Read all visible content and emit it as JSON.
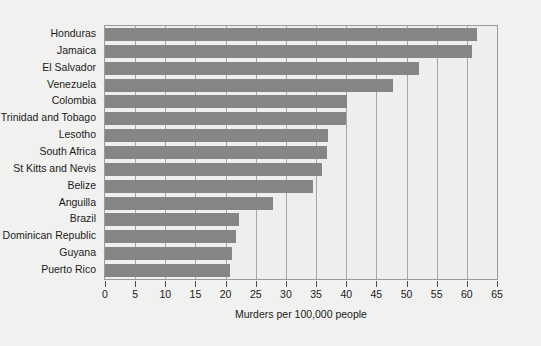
{
  "chart_data": {
    "type": "bar",
    "orientation": "horizontal",
    "title": "",
    "xlabel": "Murders per 100,000 people",
    "ylabel": "",
    "xlim": [
      0,
      65
    ],
    "xticks": [
      0,
      5,
      10,
      15,
      20,
      25,
      30,
      35,
      40,
      45,
      50,
      55,
      60,
      65
    ],
    "grid": true,
    "grid_axis": "x",
    "legend": false,
    "bar_color": "#858585",
    "plot_background": "#eeeeec",
    "figure_background": "#f1f1ef",
    "categories": [
      "Honduras",
      "Jamaica",
      "El Salvador",
      "Venezuela",
      "Colombia",
      "Trinidad and Tobago",
      "Lesotho",
      "South Africa",
      "St Kitts and Nevis",
      "Belize",
      "Anguilla",
      "Brazil",
      "Dominican Republic",
      "Guyana",
      "Puerto Rico"
    ],
    "values": [
      61.7,
      60.9,
      52.0,
      47.7,
      40.2,
      40.0,
      37.0,
      36.8,
      35.9,
      34.5,
      27.8,
      22.2,
      21.8,
      21.0,
      20.8
    ]
  }
}
